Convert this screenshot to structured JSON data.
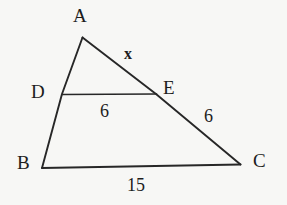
{
  "figure": {
    "type": "triangle-with-midsegment",
    "background_color": "#f7f7f5",
    "stroke_color": "#272727",
    "text_color": "#1d1d1d"
  },
  "vertices": {
    "A": {
      "label": "A",
      "x": 82,
      "y": 37
    },
    "B": {
      "label": "B",
      "x": 42,
      "y": 168
    },
    "C": {
      "label": "C",
      "x": 240,
      "y": 165
    },
    "D": {
      "label": "D",
      "x": 62,
      "y": 94
    },
    "E": {
      "label": "E",
      "x": 156,
      "y": 94
    }
  },
  "segments": [
    {
      "name": "AB",
      "from": "A",
      "to": "B"
    },
    {
      "name": "AC",
      "from": "A",
      "to": "C"
    },
    {
      "name": "BC",
      "from": "B",
      "to": "C"
    },
    {
      "name": "DE",
      "from": "D",
      "to": "E"
    }
  ],
  "measurements": {
    "AE": "x",
    "DE": "6",
    "EC": "6",
    "BC": "15"
  },
  "labels": {
    "vertex_a": "A",
    "vertex_b": "B",
    "vertex_c": "C",
    "vertex_d": "D",
    "vertex_e": "E",
    "side_ae": "x",
    "side_de": "6",
    "side_ec": "6",
    "side_bc": "15"
  }
}
